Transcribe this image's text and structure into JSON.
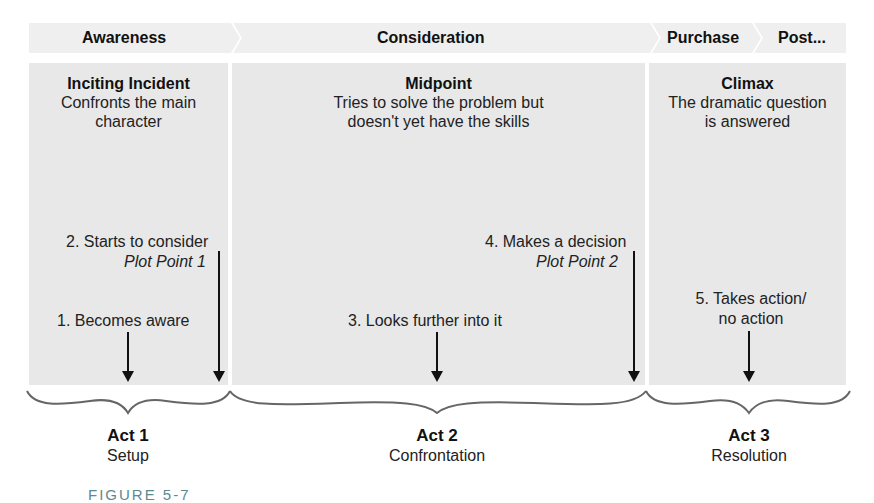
{
  "stages": [
    {
      "label": "Awareness"
    },
    {
      "label": "Consideration"
    },
    {
      "label": "Purchase"
    },
    {
      "label": "Post..."
    }
  ],
  "panels": [
    {
      "title": "Inciting Incident",
      "desc_line1": "Confronts the main",
      "desc_line2": "character"
    },
    {
      "title": "Midpoint",
      "desc_line1": "Tries to solve the problem but",
      "desc_line2": "doesn't yet have the skills"
    },
    {
      "title": "Climax",
      "desc_line1": "The dramatic question",
      "desc_line2": "is answered"
    }
  ],
  "steps": [
    {
      "label": "1. Becomes aware"
    },
    {
      "label": "2. Starts to consider",
      "plot_point": "Plot Point 1"
    },
    {
      "label": "3. Looks further into it"
    },
    {
      "label": "4. Makes a decision",
      "plot_point": "Plot Point 2"
    },
    {
      "label_line1": "5. Takes action/",
      "label_line2": "no action"
    }
  ],
  "acts": [
    {
      "title": "Act 1",
      "subtitle": "Setup"
    },
    {
      "title": "Act 2",
      "subtitle": "Confrontation"
    },
    {
      "title": "Act 3",
      "subtitle": "Resolution"
    }
  ],
  "caption": "FIGURE 5-7",
  "colors": {
    "panel": "#e8e8e8",
    "stage_bar": "#efefef",
    "arrow": "#111111",
    "brace": "#666666",
    "caption": "#5a8a8f"
  }
}
